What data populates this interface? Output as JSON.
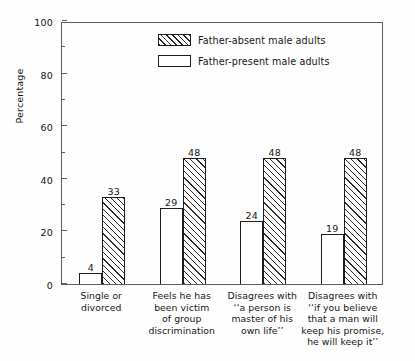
{
  "chart_data": {
    "type": "bar",
    "title": "",
    "xlabel": "",
    "ylabel": "Percentage",
    "ylim": [
      0,
      100
    ],
    "ytick_step": 20,
    "yminor_step": 10,
    "grid": false,
    "legend_position": "inside top-center",
    "yticks": [
      "0",
      "20",
      "40",
      "60",
      "80",
      "100"
    ],
    "categories": [
      "Single or\ndivorced",
      "Feels he has\nbeen victim\nof group\ndiscrimination",
      "Disagrees with\n''a person is\nmaster of his\nown life''",
      "Disagrees with\n''if you believe\nthat a man will\nkeep his promise,\nhe will keep it''"
    ],
    "category_lines": [
      [
        "Single or",
        "divorced"
      ],
      [
        "Feels he has",
        "been victim",
        "of group",
        "discrimination"
      ],
      [
        "Disagrees with",
        "‘‘a person is",
        "master of his",
        "own life’’"
      ],
      [
        "Disagrees with",
        "‘‘if you believe",
        "that a man will",
        "keep his promise,",
        "he will keep it’’"
      ]
    ],
    "series": [
      {
        "name": "Father-present male adults",
        "pattern": "solid-white",
        "values": [
          4,
          29,
          24,
          19
        ]
      },
      {
        "name": "Father-absent male adults",
        "pattern": "diagonal-hatch",
        "values": [
          33,
          48,
          48,
          48
        ]
      }
    ]
  },
  "legend": {
    "entries": [
      {
        "label": "Father-absent male adults",
        "pattern": "diagonal-hatch"
      },
      {
        "label": "Father-present male adults",
        "pattern": "solid-white"
      }
    ]
  },
  "colors": {
    "axis": "#5d5d5d",
    "bar_outline": "#1d1d1d",
    "hatch": "#2a2a2a",
    "text": "#151515",
    "background": "#fefefe"
  }
}
